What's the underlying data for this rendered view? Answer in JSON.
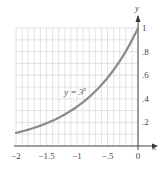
{
  "chart_data": {
    "type": "line",
    "title": "",
    "xlabel": "x",
    "ylabel": "y",
    "xlim": [
      -2,
      0
    ],
    "ylim": [
      0,
      1
    ],
    "grid": true,
    "x_ticks": [
      -2,
      -1.5,
      -1,
      -0.5,
      0
    ],
    "x_tick_labels": [
      "−2",
      "−1.5",
      "−1",
      "−.5",
      "0"
    ],
    "y_ticks": [
      0.2,
      0.4,
      0.6,
      0.8,
      1
    ],
    "y_tick_labels": [
      ".2",
      ".4",
      ".6",
      ".8",
      "1"
    ],
    "series": [
      {
        "name": "y = 3^x",
        "function": "3^x",
        "x": [
          -2,
          -1.75,
          -1.5,
          -1.25,
          -1,
          -0.75,
          -0.5,
          -0.25,
          0
        ],
        "values": [
          0.111,
          0.146,
          0.192,
          0.253,
          0.333,
          0.439,
          0.577,
          0.76,
          1.0
        ]
      }
    ],
    "annotations": [
      {
        "text": "y = 3",
        "superscript": "x",
        "x": -0.85,
        "y": 0.55
      }
    ],
    "colors": {
      "curve": "#8a8a8a",
      "axis": "#444444",
      "grid": "#d0d0d0"
    }
  }
}
